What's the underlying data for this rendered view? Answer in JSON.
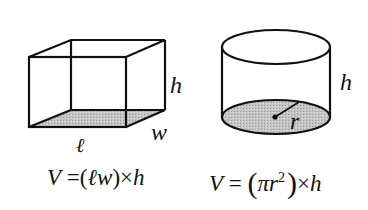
{
  "figure": {
    "box": {
      "labels": {
        "length": "ℓ",
        "width": "w",
        "height": "h"
      },
      "base_fill": "#bdbdbd"
    },
    "cylinder": {
      "labels": {
        "radius": "r",
        "height": "h"
      },
      "base_fill": "#bdbdbd"
    },
    "formulas": {
      "box": {
        "lhs": "V",
        "eq": "=",
        "open": "(",
        "l": "ℓ",
        "w": "w",
        "close": ")",
        "times": "×",
        "h": "h"
      },
      "cylinder": {
        "lhs": "V",
        "eq": "=",
        "open": "(",
        "pi": "π",
        "r": "r",
        "exp": "2",
        "close": ")",
        "times": "×",
        "h": "h"
      }
    }
  }
}
